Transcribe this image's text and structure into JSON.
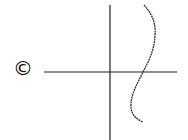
{
  "diagram": {
    "panel_label": "©",
    "axes": {
      "horizontal": {
        "x1": 44,
        "y1": 72,
        "x2": 177,
        "y2": 72
      },
      "vertical": {
        "x1": 110,
        "y1": 5,
        "x2": 110,
        "y2": 140
      }
    },
    "curve": {
      "description": "wavy S-shaped curve crossing the horizontal axis to the right of the vertical axis",
      "path": "M144,5 C152,14 156,22 155,36 C154,52 148,62 143,72 C137,84 130,96 131,108 C132,116 138,120 143,122"
    },
    "colors": {
      "line": "#222222",
      "background": "#ffffff"
    }
  }
}
